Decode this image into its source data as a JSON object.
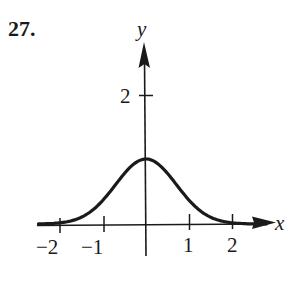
{
  "problem": {
    "number": "27."
  },
  "chart_data": {
    "type": "line",
    "title": "",
    "xlabel": "x",
    "ylabel": "y",
    "x_ticks": [
      -2,
      -1,
      1,
      2
    ],
    "x_tick_labels": [
      "−2",
      "−1",
      "1",
      "2"
    ],
    "y_ticks": [
      2
    ],
    "y_tick_labels": [
      "2"
    ],
    "xlim": [
      -2.5,
      3
    ],
    "ylim": [
      0,
      3
    ],
    "grid": false,
    "legend": null,
    "series": [
      {
        "name": "bell curve",
        "x": [
          -2.5,
          -2,
          -1.5,
          -1,
          -0.5,
          0,
          0.5,
          1,
          1.5,
          2,
          2.5
        ],
        "y": [
          0.002,
          0.018,
          0.105,
          0.368,
          0.779,
          1.0,
          0.779,
          0.368,
          0.105,
          0.018,
          0.002
        ]
      }
    ]
  }
}
